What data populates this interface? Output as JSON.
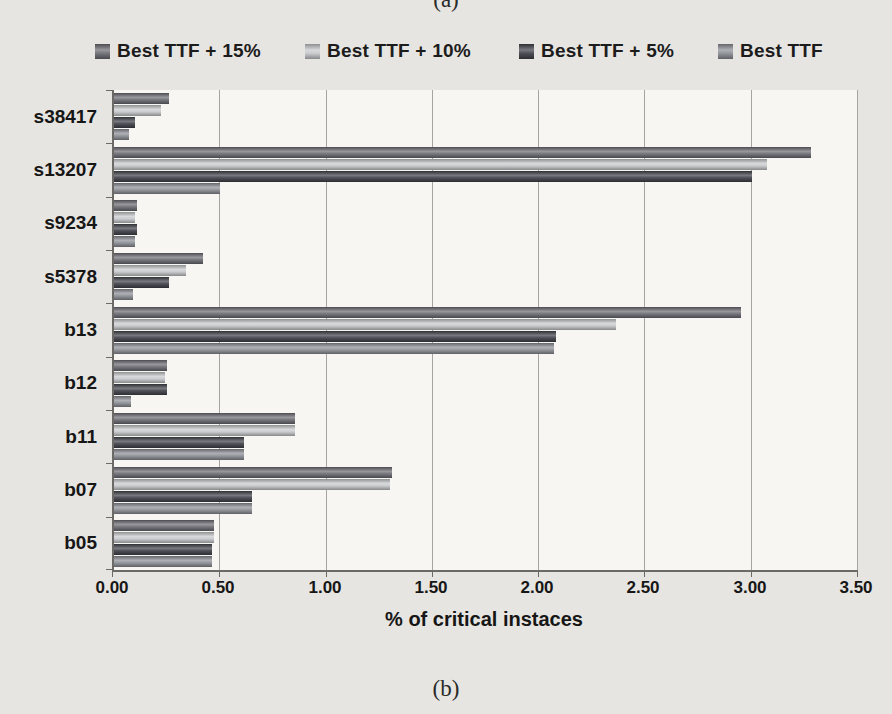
{
  "figure": {
    "caption_top": "(a)",
    "caption_bottom": "(b)"
  },
  "chart_data": {
    "type": "bar",
    "orientation": "horizontal",
    "title": "",
    "xlabel": "% of critical instaces",
    "ylabel": "",
    "categories": [
      "s38417",
      "s13207",
      "s9234",
      "s5378",
      "b13",
      "b12",
      "b11",
      "b07",
      "b05"
    ],
    "series": [
      {
        "name": "Best TTF + 15%",
        "color": "#6a6a72",
        "values": [
          0.26,
          3.28,
          0.11,
          0.42,
          2.95,
          0.25,
          0.85,
          1.31,
          0.47
        ]
      },
      {
        "name": "Best TTF + 10%",
        "color": "#c6c8cb",
        "values": [
          0.22,
          3.07,
          0.1,
          0.34,
          2.36,
          0.24,
          0.85,
          1.3,
          0.47
        ]
      },
      {
        "name": "Best TTF + 5%",
        "color": "#40404a",
        "values": [
          0.1,
          3.0,
          0.11,
          0.26,
          2.08,
          0.25,
          0.61,
          0.65,
          0.46
        ]
      },
      {
        "name": "Best TTF",
        "color": "#8b8e95",
        "values": [
          0.07,
          0.5,
          0.1,
          0.09,
          2.07,
          0.08,
          0.61,
          0.65,
          0.46
        ]
      }
    ],
    "xlim": [
      0,
      3.5
    ],
    "xticks": [
      "0.00",
      "0.50",
      "1.00",
      "1.50",
      "2.00",
      "2.50",
      "3.00",
      "3.50"
    ],
    "grid": true,
    "legend_position": "top"
  }
}
